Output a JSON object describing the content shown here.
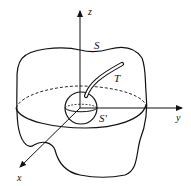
{
  "diagram": {
    "type": "3d-surface-with-axes",
    "labels": {
      "z_axis": "z",
      "y_axis": "y",
      "x_axis": "x",
      "outer_surface": "S",
      "tube": "T",
      "inner_sphere": "S'"
    },
    "colors": {
      "stroke": "#111111",
      "background": "#ffffff"
    }
  }
}
